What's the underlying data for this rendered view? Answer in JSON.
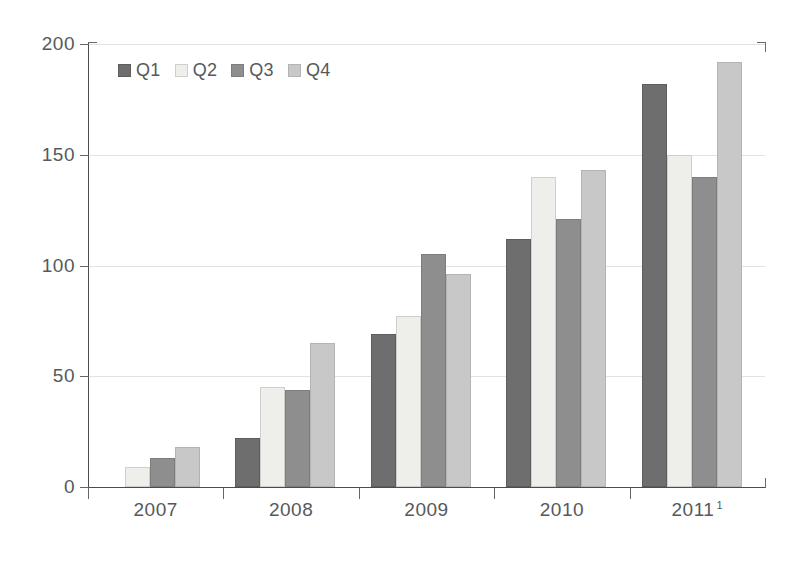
{
  "chart_data": {
    "type": "bar",
    "title": "",
    "subtitle": "",
    "xlabel": "",
    "ylabel": "",
    "ylim": [
      0,
      200
    ],
    "yticks": [
      0,
      50,
      100,
      150,
      200
    ],
    "ytick_labels": [
      "0",
      "50",
      "100",
      "150",
      "200"
    ],
    "grid": true,
    "grid_axis": "y",
    "legend_position": "top-left",
    "categories": [
      "2007",
      "2008",
      "2009",
      "2010",
      "2011"
    ],
    "category_labels": [
      "2007",
      "2008",
      "2009",
      "2010",
      "2011"
    ],
    "category_footnotes": [
      "",
      "",
      "",
      "",
      "1"
    ],
    "series": [
      {
        "name": "Q1",
        "color": "#6e6e6e",
        "values": [
          null,
          22,
          69,
          112,
          182
        ]
      },
      {
        "name": "Q2",
        "color": "#eeeeea",
        "values": [
          9,
          45,
          77,
          140,
          150
        ]
      },
      {
        "name": "Q3",
        "color": "#8e8e8e",
        "values": [
          13,
          44,
          105,
          121,
          140
        ]
      },
      {
        "name": "Q4",
        "color": "#c8c8c8",
        "values": [
          18,
          65,
          96,
          143,
          192
        ]
      }
    ]
  },
  "legend": {
    "items": [
      {
        "label": "Q1"
      },
      {
        "label": "Q2"
      },
      {
        "label": "Q3"
      },
      {
        "label": "Q4"
      }
    ]
  },
  "axes": {
    "y": {
      "ticks": [
        {
          "label": "200"
        },
        {
          "label": "150"
        },
        {
          "label": "100"
        },
        {
          "label": "50"
        },
        {
          "label": "0"
        }
      ]
    },
    "x": {
      "ticks": [
        {
          "label": "2007",
          "footnote": ""
        },
        {
          "label": "2008",
          "footnote": ""
        },
        {
          "label": "2009",
          "footnote": ""
        },
        {
          "label": "2010",
          "footnote": ""
        },
        {
          "label": "2011",
          "footnote": "1"
        }
      ]
    }
  }
}
